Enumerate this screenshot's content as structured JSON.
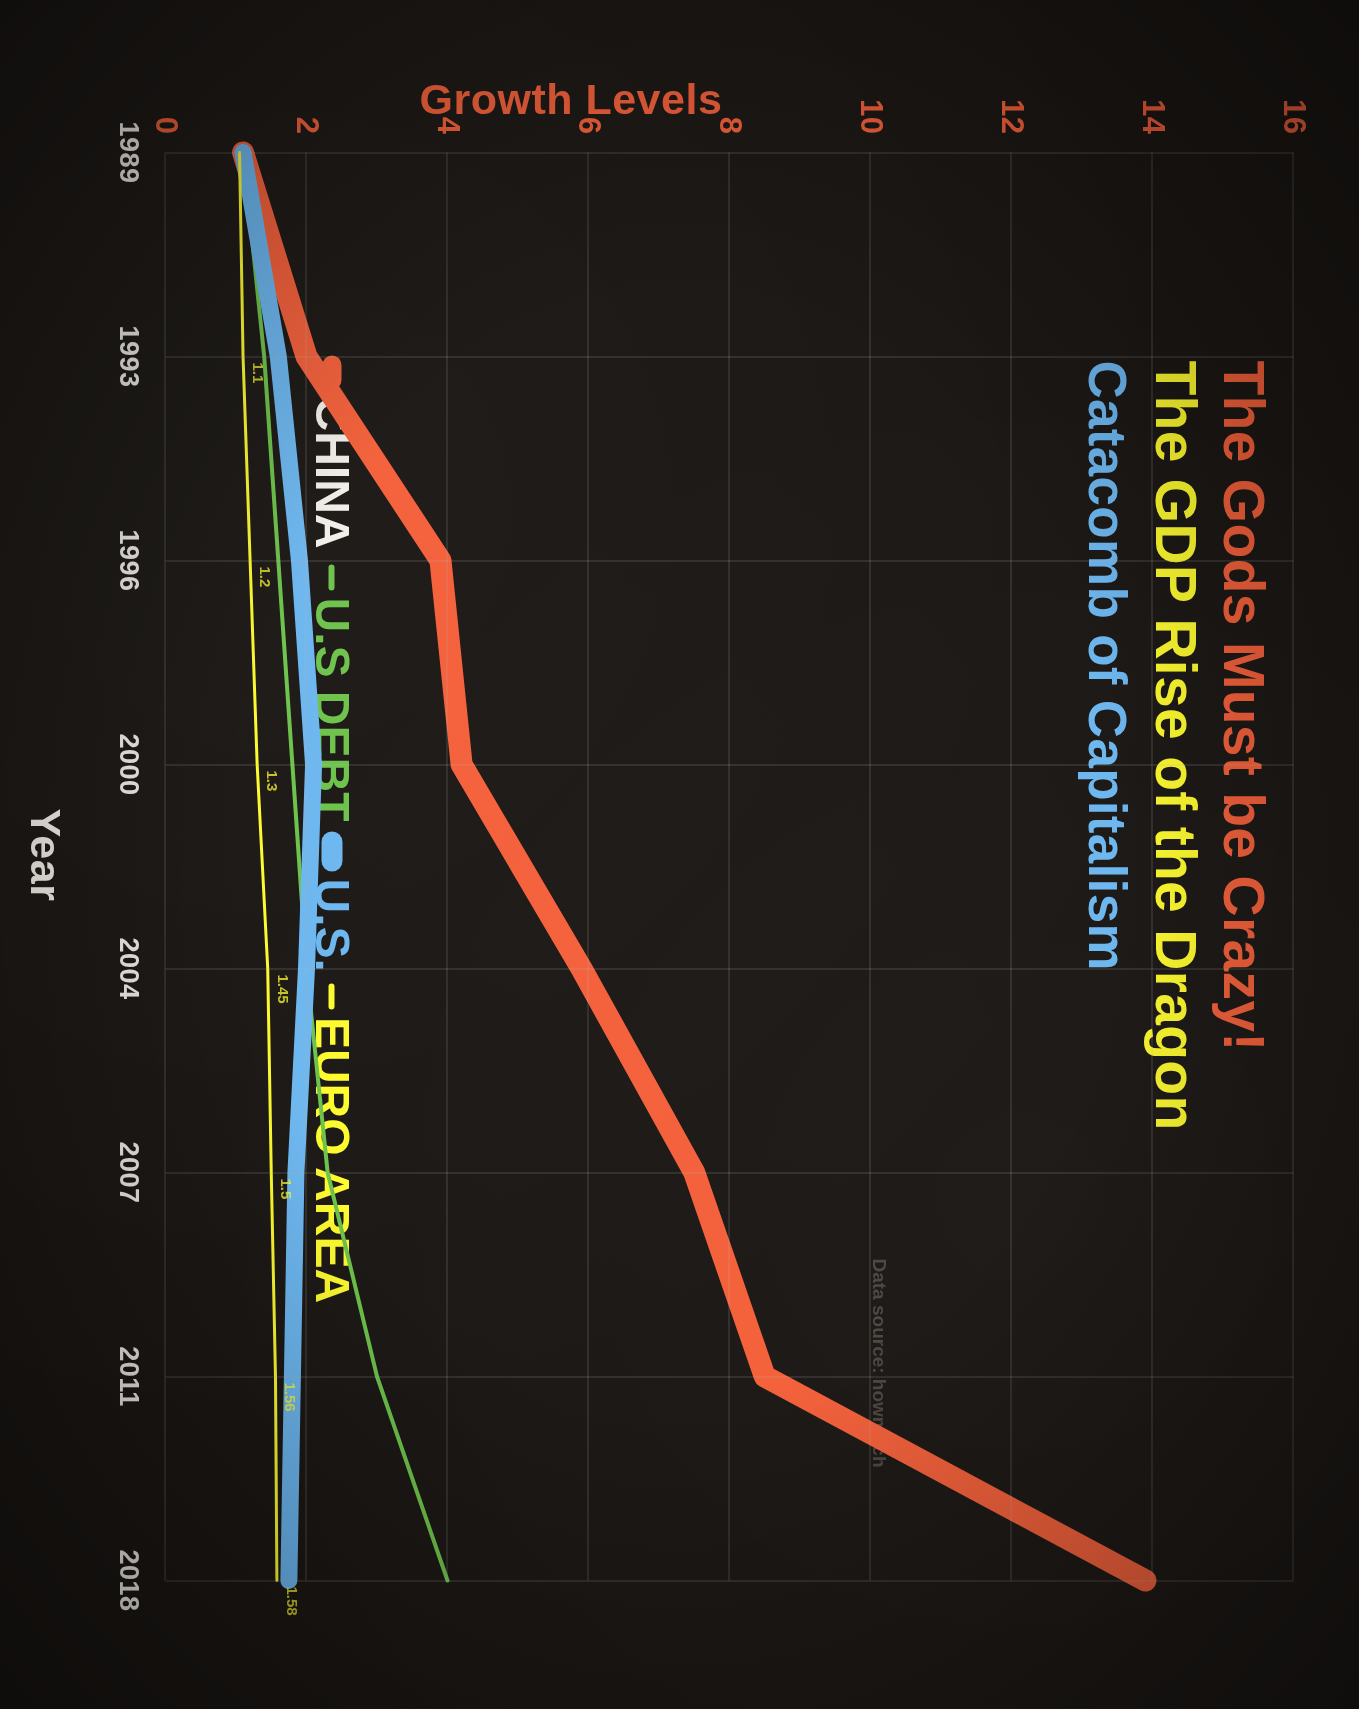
{
  "titles": {
    "line1": "The Gods Must be Crazy!",
    "line2": "The GDP Rise of the Dragon",
    "line3": "Catacomb of Capitalism",
    "color1": "#f4603a",
    "color2": "#fdfa2e",
    "color3": "#6cb6ef"
  },
  "legend": {
    "items": [
      {
        "label": "CHINA",
        "color": "#f4603a",
        "text_color": "#f2efe9"
      },
      {
        "label": "U.S DEBT",
        "color": "#6cc24a",
        "text_color": "#6cc24a"
      },
      {
        "label": "U.S.",
        "color": "#6cb6ef",
        "text_color": "#6cb6ef"
      },
      {
        "label": "EURO AREA",
        "color": "#fdfa2e",
        "text_color": "#fdfa2e"
      }
    ]
  },
  "source_note": "Data source: howmuch",
  "chart_data": {
    "type": "line",
    "xlabel": "Year",
    "ylabel": "Growth Levels",
    "x": [
      1989,
      1993,
      1996,
      2000,
      2004,
      2007,
      2011,
      2018
    ],
    "categories": [
      "1989",
      "1993",
      "1996",
      "2000",
      "2004",
      "2007",
      "2011",
      "2018"
    ],
    "ylim": [
      0,
      16
    ],
    "yticks": [
      16,
      14,
      12,
      10,
      8,
      6,
      4,
      2,
      0
    ],
    "grid": true,
    "legend_position": "top-left",
    "series": [
      {
        "name": "CHINA",
        "color": "#f4603a",
        "width": 22,
        "values": [
          1.1,
          2.0,
          3.9,
          4.2,
          5.9,
          7.5,
          8.5,
          13.9
        ]
      },
      {
        "name": "U.S DEBT",
        "color": "#6cc24a",
        "width": 4,
        "values": [
          1.1,
          1.4,
          1.6,
          1.8,
          2.0,
          2.3,
          3.0,
          4.0
        ]
      },
      {
        "name": "U.S.",
        "color": "#6cb6ef",
        "width": 17,
        "values": [
          1.1,
          1.6,
          1.9,
          2.1,
          2.0,
          1.85,
          1.8,
          1.75
        ]
      },
      {
        "name": "EURO AREA",
        "color": "#fdfa2e",
        "width": 3,
        "values": [
          1.05,
          1.1,
          1.2,
          1.3,
          1.45,
          1.5,
          1.56,
          1.58
        ]
      }
    ],
    "point_labels": [
      {
        "series": "EURO AREA",
        "x": "2018",
        "text": "1.58"
      },
      {
        "series": "EURO AREA",
        "x": "2011",
        "text": "1.56"
      },
      {
        "series": "EURO AREA",
        "x": "2007",
        "text": "1.5"
      },
      {
        "series": "EURO AREA",
        "x": "2004",
        "text": "1.45"
      },
      {
        "series": "EURO AREA",
        "x": "2000",
        "text": "1.3"
      },
      {
        "series": "EURO AREA",
        "x": "1996",
        "text": "1.2"
      },
      {
        "series": "EURO AREA",
        "x": "1993",
        "text": "1.1"
      }
    ]
  }
}
